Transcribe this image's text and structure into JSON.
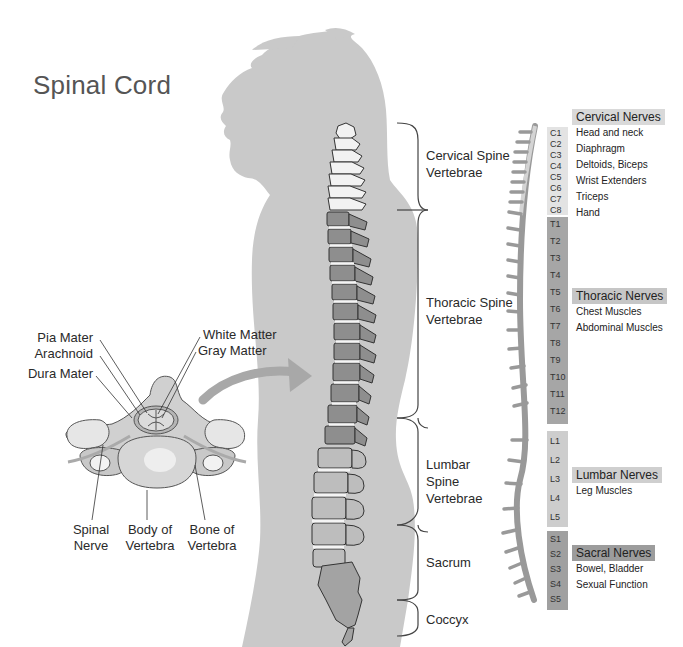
{
  "title": "Spinal Cord",
  "cross_section": {
    "labels_top_left": [
      "Pia Mater",
      "Arachnoid",
      "Dura Mater"
    ],
    "labels_top_right": [
      "White Matter",
      "Gray Matter"
    ],
    "labels_bottom": [
      {
        "line1": "Spinal",
        "line2": "Nerve"
      },
      {
        "line1": "Body of",
        "line2": "Vertebra"
      },
      {
        "line1": "Bone of",
        "line2": "Vertebra"
      }
    ]
  },
  "regions": [
    {
      "line1": "Cervical Spine",
      "line2": "Vertebrae"
    },
    {
      "line1": "Thoracic Spine",
      "line2": "Vertebrae"
    },
    {
      "line1": "Lumbar",
      "line2": "Spine",
      "line3": "Vertebrae"
    },
    {
      "line1": "Sacrum"
    },
    {
      "line1": "Coccyx"
    }
  ],
  "segments": {
    "cervical": [
      "C1",
      "C2",
      "C3",
      "C4",
      "C5",
      "C6",
      "C7",
      "C8"
    ],
    "thoracic": [
      "T1",
      "T2",
      "T3",
      "T4",
      "T5",
      "T6",
      "T7",
      "T8",
      "T9",
      "T10",
      "T11",
      "T12"
    ],
    "lumbar": [
      "L1",
      "L2",
      "L3",
      "L4",
      "L5"
    ],
    "sacral": [
      "S1",
      "S2",
      "S3",
      "S4",
      "S5"
    ]
  },
  "nerves": {
    "cervical": {
      "heading": "Cervical Nerves",
      "items": [
        "Head and neck",
        "Diaphragm",
        "Deltoids, Biceps",
        "Wrist Extenders",
        "Triceps",
        "Hand"
      ]
    },
    "thoracic": {
      "heading": "Thoracic Nerves",
      "items": [
        "Chest Muscles",
        "Abdominal Muscles"
      ]
    },
    "lumbar": {
      "heading": "Lumbar Nerves",
      "items": [
        "Leg Muscles"
      ]
    },
    "sacral": {
      "heading": "Sacral Nerves",
      "items": [
        "Bowel, Bladder",
        "Sexual Function"
      ]
    }
  },
  "colors": {
    "silhouette": "#c9c9c9",
    "cervical": "#f2f2f2",
    "thoracic": "#8e8e8e",
    "lumbar": "#bdbdbd",
    "sacral": "#a3a3a3",
    "head_cervical": "#d9d9d9",
    "head_thoracic": "#c2c2c2",
    "head_lumbar": "#cccccc",
    "head_sacral": "#9a9a9a"
  }
}
